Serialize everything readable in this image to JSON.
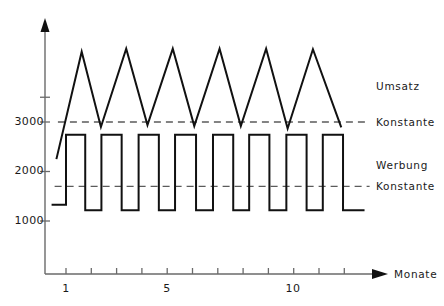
{
  "chart_data": {
    "type": "line",
    "title": "",
    "subtitle": "",
    "xlabel": "Monate",
    "ylabel": "",
    "xlim": [
      0.4,
      13.2
    ],
    "ylim": [
      600,
      4700
    ],
    "grid": false,
    "legend_position": "right-inline",
    "x_ticks": [
      1,
      2,
      3,
      4,
      5,
      6,
      7,
      8,
      9,
      10,
      11,
      12
    ],
    "x_tick_labels": [
      "1",
      "",
      "",
      "",
      "5",
      "",
      "",
      "",
      "",
      "10",
      "",
      ""
    ],
    "y_ticks": [
      1000,
      2000,
      3000,
      3500
    ],
    "y_tick_labels": [
      "1000",
      "2000",
      "3000",
      ""
    ],
    "series": [
      {
        "name": "Umsatz",
        "type": "line",
        "style": "solid",
        "color": "#111111",
        "points": [
          [
            0.62,
            2250
          ],
          [
            1.62,
            4420
          ],
          [
            2.38,
            2900
          ],
          [
            3.38,
            4480
          ],
          [
            4.22,
            2940
          ],
          [
            5.22,
            4480
          ],
          [
            6.07,
            2920
          ],
          [
            7.07,
            4480
          ],
          [
            7.91,
            2920
          ],
          [
            8.91,
            4480
          ],
          [
            9.76,
            2870
          ],
          [
            10.76,
            4470
          ],
          [
            11.88,
            2890
          ]
        ]
      },
      {
        "name": "Werbung",
        "type": "step",
        "style": "solid",
        "color": "#111111",
        "points": [
          [
            0.43,
            1330
          ],
          [
            1.0,
            1330
          ],
          [
            1.0,
            2740
          ],
          [
            1.76,
            2740
          ],
          [
            1.76,
            1215
          ],
          [
            2.4,
            1215
          ],
          [
            2.4,
            2740
          ],
          [
            3.2,
            2740
          ],
          [
            3.2,
            1215
          ],
          [
            3.87,
            1215
          ],
          [
            3.87,
            2740
          ],
          [
            4.67,
            2740
          ],
          [
            4.67,
            1215
          ],
          [
            5.31,
            1215
          ],
          [
            5.31,
            2740
          ],
          [
            6.14,
            2740
          ],
          [
            6.14,
            1215
          ],
          [
            6.81,
            1215
          ],
          [
            6.81,
            2740
          ],
          [
            7.61,
            2740
          ],
          [
            7.61,
            1215
          ],
          [
            8.24,
            1215
          ],
          [
            8.24,
            2740
          ],
          [
            9.04,
            2740
          ],
          [
            9.04,
            1215
          ],
          [
            9.71,
            1215
          ],
          [
            9.71,
            2740
          ],
          [
            10.51,
            2740
          ],
          [
            10.51,
            1215
          ],
          [
            11.15,
            1215
          ],
          [
            11.15,
            2740
          ],
          [
            11.95,
            2740
          ],
          [
            11.95,
            1215
          ],
          [
            12.8,
            1215
          ]
        ]
      },
      {
        "name": "Konstante",
        "type": "hline",
        "style": "dashed",
        "color": "#5b5b5b",
        "value": 3000,
        "x_from": 0.68,
        "x_to": 13.0
      },
      {
        "name": "Konstante",
        "type": "hline",
        "style": "dashed",
        "color": "#5b5b5b",
        "value": 1700,
        "x_from": 0.55,
        "x_to": 13.0
      }
    ],
    "annotations": [
      {
        "text": "Umsatz",
        "x": 13.5,
        "y": 3800
      },
      {
        "text": "Konstante",
        "x": 13.5,
        "y": 3000
      },
      {
        "text": "Werbung",
        "x": 13.5,
        "y": 2150
      },
      {
        "text": "Konstante",
        "x": 13.5,
        "y": 1700
      }
    ]
  },
  "axes": {
    "y_labels": [
      {
        "text": "3000",
        "value": 3000
      },
      {
        "text": "2000",
        "value": 2000
      },
      {
        "text": "1000",
        "value": 1000
      }
    ],
    "x_labels": [
      {
        "text": "1",
        "value": 1
      },
      {
        "text": "5",
        "value": 5
      },
      {
        "text": "10",
        "value": 10
      }
    ],
    "x_axis_title": "Monate"
  },
  "labels": {
    "umsatz": "Umsatz",
    "konstante_upper": "Konstante",
    "werbung": "Werbung",
    "konstante_lower": "Konstante"
  },
  "colors": {
    "line": "#111111",
    "dashed": "#5b5b5b",
    "axis": "#6a6a6a",
    "text": "#1a1a1a",
    "background": "#ffffff"
  }
}
